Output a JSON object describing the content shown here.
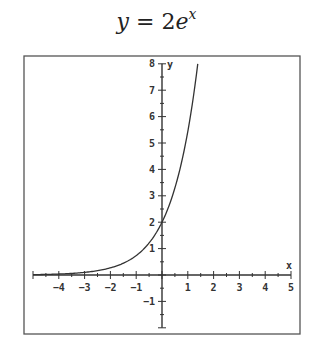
{
  "chart_data": {
    "type": "line",
    "title_parts": {
      "lhs": "y",
      "eq": " = 2",
      "base": "e",
      "exp": "x"
    },
    "xlabel": "x",
    "ylabel": "y",
    "xlim": [
      -5,
      5
    ],
    "ylim": [
      -2,
      8
    ],
    "grid": false,
    "legend": null,
    "x_ticks": [
      -4,
      -3,
      -2,
      -1,
      1,
      2,
      3,
      4,
      5
    ],
    "y_ticks": [
      -1,
      1,
      2,
      3,
      4,
      5,
      6,
      7,
      8
    ],
    "minor_tick_step": 0.5,
    "series": [
      {
        "name": "y = 2e^x",
        "x": [
          -5,
          -4,
          -3,
          -2,
          -1,
          0,
          0.5,
          1,
          1.386
        ],
        "y": [
          0.013,
          0.037,
          0.1,
          0.27,
          0.74,
          2,
          3.3,
          5.44,
          8
        ]
      }
    ],
    "colors": {
      "curve": "#333333",
      "axes": "#333333",
      "frame": "#555555"
    }
  }
}
